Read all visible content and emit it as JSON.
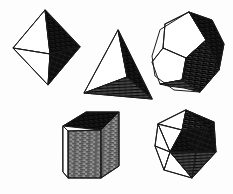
{
  "plate": {
    "title": "The Five Platonic Solids",
    "background_color": "#fdfdfd",
    "ink_color": "#1a1a1a",
    "style": "pen-and-ink hatched engraving",
    "width": 233,
    "height": 194
  },
  "palette": {
    "ink": "#1a1a1a",
    "paper": "#fdfdfd",
    "light_face": "#ffffff",
    "dark_face": "#2b2b2b",
    "mid_face": "#6b6b6b",
    "hatch_line": "#111111"
  },
  "solids": [
    {
      "id": "octahedron",
      "name": "Octahedron",
      "faces": 8,
      "face_shape": "triangle",
      "position": "top-left",
      "shading": "left faces light, right faces dark crosshatch"
    },
    {
      "id": "tetrahedron",
      "name": "Tetrahedron",
      "faces": 4,
      "face_shape": "triangle",
      "position": "top-center",
      "shading": "left face light, right face dark, bottom face hatched"
    },
    {
      "id": "dodecahedron",
      "name": "Dodecahedron",
      "faces": 12,
      "face_shape": "pentagon",
      "position": "top-right",
      "shading": "upper-left pentagons light, center and right pentagons dark hatch"
    },
    {
      "id": "hexahedron",
      "name": "Cube",
      "faces": 6,
      "face_shape": "square",
      "position": "bottom-center-left",
      "shading": "top face dark hatch, front face mid hatch, left sliver light"
    },
    {
      "id": "icosahedron",
      "name": "Icosahedron",
      "faces": 20,
      "face_shape": "triangle",
      "position": "bottom-right",
      "shading": "left triangles light, center and right triangles dark hatch"
    }
  ]
}
